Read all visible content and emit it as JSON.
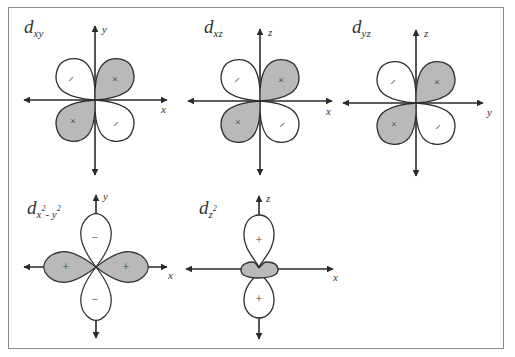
{
  "figure": {
    "colors": {
      "positive_lobe": "#b9b9b9",
      "negative_lobe": "#ffffff",
      "outline": "#2e2e2e",
      "axis": "#2a2a2a",
      "frame": "#8a8a8a"
    },
    "orbitals": [
      {
        "id": "dxy",
        "title_main": "d",
        "title_sub": "xy",
        "horizontal_axis": "x",
        "vertical_axis": "y",
        "lobe_signs": {
          "upper_right": "+",
          "lower_left": "+",
          "upper_left": "−",
          "lower_right": "−"
        }
      },
      {
        "id": "dxz",
        "title_main": "d",
        "title_sub": "xz",
        "horizontal_axis": "x",
        "vertical_axis": "z",
        "lobe_signs": {
          "upper_right": "+",
          "lower_left": "+",
          "upper_left": "−",
          "lower_right": "−"
        }
      },
      {
        "id": "dyz",
        "title_main": "d",
        "title_sub": "yz",
        "horizontal_axis": "y",
        "vertical_axis": "z",
        "lobe_signs": {
          "upper_right": "+",
          "lower_left": "+",
          "upper_left": "−",
          "lower_right": "−"
        }
      },
      {
        "id": "dx2-y2",
        "title_main": "d",
        "title_sub": "x",
        "title_sup1": "2",
        "title_sub2": "- y",
        "title_sup2": "2",
        "horizontal_axis": "x",
        "vertical_axis": "y",
        "lobe_signs": {
          "left": "+",
          "right": "+",
          "top": "−",
          "bottom": "−"
        }
      },
      {
        "id": "dz2",
        "title_main": "d",
        "title_sub": "z",
        "title_sup1": "2",
        "horizontal_axis": "x",
        "vertical_axis": "z",
        "lobe_signs": {
          "top": "+",
          "bottom": "+",
          "ring": ""
        }
      }
    ]
  }
}
